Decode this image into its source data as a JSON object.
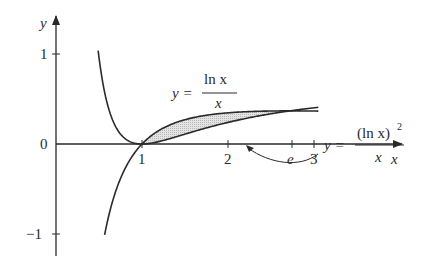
{
  "figure": {
    "x_axis_label": "x",
    "y_axis_label": "y",
    "x_ticks": [
      {
        "label": "1",
        "value": 1
      },
      {
        "label": "2",
        "value": 2
      },
      {
        "label": "e",
        "value": 2.718
      },
      {
        "label": "3",
        "value": 3
      }
    ],
    "y_ticks": [
      {
        "label": "1",
        "value": 1
      },
      {
        "label": "0",
        "value": 0
      },
      {
        "label": "−1",
        "value": -1
      }
    ],
    "curve1": {
      "lhs": "y =",
      "numerator": "ln x",
      "denominator": "x"
    },
    "curve2": {
      "lhs": "y =",
      "numerator": "(ln x)",
      "exponent": "2",
      "denominator": "x"
    },
    "shaded_region": "area between y = ln x / x and y = (ln x)^2 / x from x = 1 to x = e",
    "colors": {
      "ink": "#2a2a2a",
      "shade": "#d4d4d4"
    }
  }
}
